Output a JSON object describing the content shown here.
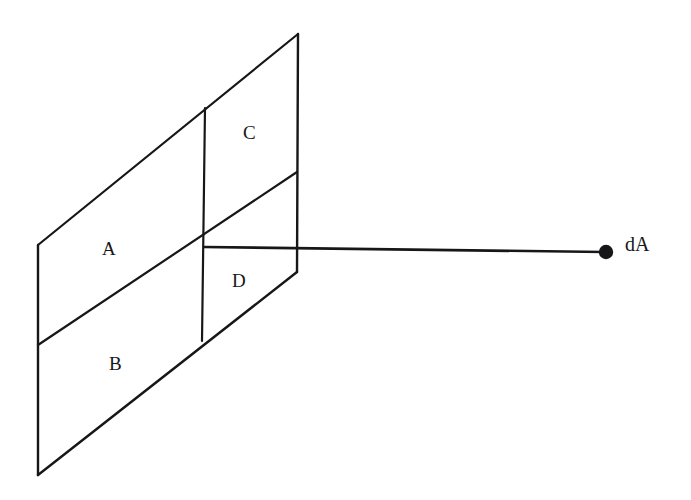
{
  "figure": {
    "type": "line-diagram",
    "background_color": "#ffffff",
    "stroke_color": "#17171a",
    "stroke_width": 2,
    "width": 691,
    "height": 500
  },
  "labels": {
    "region_a": "A",
    "region_b": "B",
    "region_c": "C",
    "region_d": "D",
    "point_da": "dA"
  },
  "label_positions": {
    "region_a": {
      "x": 102,
      "y": 239
    },
    "region_b": {
      "x": 109,
      "y": 354
    },
    "region_c": {
      "x": 243,
      "y": 123
    },
    "region_d": {
      "x": 232,
      "y": 271
    },
    "point_da": {
      "x": 625,
      "y": 234
    }
  },
  "geometry": {
    "left_edge": {
      "x1": 38,
      "y1": 245,
      "x2": 38,
      "y2": 475
    },
    "top_diagonal": {
      "x1": 38,
      "y1": 245,
      "x2": 298,
      "y2": 34
    },
    "right_edge": {
      "x1": 298,
      "y1": 34,
      "x2": 297,
      "y2": 272
    },
    "center_vertical": {
      "x1": 205,
      "y1": 108,
      "x2": 202,
      "y2": 341
    },
    "middle_diagonal": {
      "x1": 38,
      "y1": 345,
      "x2": 297,
      "y2": 172
    },
    "bottom_diagonal": {
      "x1": 38,
      "y1": 475,
      "x2": 297,
      "y2": 272
    },
    "ray_to_da": {
      "x1": 204,
      "y1": 247,
      "x2": 606,
      "y2": 252
    },
    "intersection_point": {
      "x": 204,
      "y": 247
    },
    "da_dot": {
      "cx": 606,
      "cy": 252,
      "r": 7
    }
  }
}
